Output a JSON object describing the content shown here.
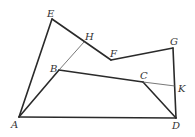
{
  "diagram": {
    "type": "geometry-figure",
    "points": {
      "A": {
        "label": "A",
        "x": 19,
        "y": 117,
        "lx": 11,
        "ly": 128
      },
      "B": {
        "label": "B",
        "x": 59,
        "y": 70,
        "lx": 50,
        "ly": 72
      },
      "C": {
        "label": "C",
        "x": 143,
        "y": 82,
        "lx": 140,
        "ly": 79
      },
      "D": {
        "label": "D",
        "x": 176,
        "y": 118,
        "lx": 172,
        "ly": 129
      },
      "E": {
        "label": "E",
        "x": 52,
        "y": 19,
        "lx": 47,
        "ly": 17
      },
      "F": {
        "label": "F",
        "x": 111,
        "y": 60,
        "lx": 110,
        "ly": 57
      },
      "G": {
        "label": "G",
        "x": 173,
        "y": 48,
        "lx": 170,
        "ly": 45
      },
      "H": {
        "label": "H",
        "x": 84,
        "y": 42,
        "lx": 85,
        "ly": 40
      },
      "K": {
        "label": "K",
        "x": 175,
        "y": 86,
        "lx": 178,
        "ly": 92
      }
    },
    "thick_segments": [
      [
        "A",
        "E"
      ],
      [
        "E",
        "F"
      ],
      [
        "F",
        "G"
      ],
      [
        "G",
        "D"
      ],
      [
        "A",
        "D"
      ],
      [
        "A",
        "B"
      ],
      [
        "B",
        "C"
      ],
      [
        "C",
        "D"
      ]
    ],
    "thin_segments": [
      [
        "B",
        "H"
      ],
      [
        "C",
        "K"
      ]
    ]
  }
}
